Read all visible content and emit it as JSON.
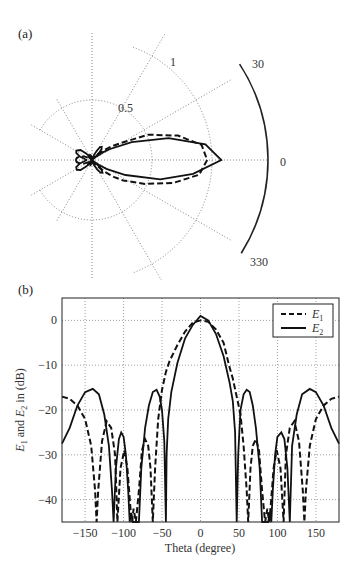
{
  "chart_data": [
    {
      "panel": "(a)",
      "type": "polar-line",
      "r_ticks": [
        "0.5",
        "1"
      ],
      "angle_labels": [
        "30",
        "0",
        "330"
      ],
      "series": [
        {
          "name": "E1",
          "style": "dashed",
          "main_lobe_peak": 1.0,
          "half_width_deg": 45
        },
        {
          "name": "E2",
          "style": "solid",
          "main_lobe_peak": 1.1,
          "half_width_deg": 45
        }
      ],
      "polar_scale": {
        "r_max_px": 120,
        "outer_arc_px": 176
      }
    },
    {
      "panel": "(b)",
      "type": "line",
      "xlabel": "Theta (degree)",
      "ylabel": "E1 and E2 in (dB)",
      "xlim": [
        -180,
        180
      ],
      "ylim": [
        -45,
        5
      ],
      "xticks": [
        -150,
        -100,
        -50,
        0,
        50,
        100,
        150
      ],
      "yticks": [
        0,
        -10,
        -20,
        -30,
        -40
      ],
      "grid": true,
      "legend": {
        "position": "upper right",
        "entries": [
          "E1",
          "E2"
        ]
      },
      "series": [
        {
          "name": "E1",
          "style": "dashed",
          "points": [
            [
              -180,
              -17
            ],
            [
              -170,
              -17.5
            ],
            [
              -160,
              -19
            ],
            [
              -150,
              -22
            ],
            [
              -142,
              -28
            ],
            [
              -137,
              -38
            ],
            [
              -135,
              -45
            ],
            [
              -133,
              -38
            ],
            [
              -128,
              -27
            ],
            [
              -122,
              -22.5
            ],
            [
              -116,
              -24
            ],
            [
              -111,
              -30
            ],
            [
              -108,
              -45
            ],
            [
              -104,
              -33
            ],
            [
              -99,
              -29
            ],
            [
              -95,
              -33
            ],
            [
              -91,
              -42
            ],
            [
              -89,
              -45
            ],
            [
              -87,
              -42
            ],
            [
              -84,
              -45
            ],
            [
              -80,
              -38
            ],
            [
              -76,
              -29
            ],
            [
              -72,
              -26.5
            ],
            [
              -68,
              -28
            ],
            [
              -65,
              -33
            ],
            [
              -62,
              -45
            ],
            [
              -59,
              -33
            ],
            [
              -55,
              -22
            ],
            [
              -50,
              -15.5
            ],
            [
              -45,
              -11.5
            ],
            [
              -40,
              -9
            ],
            [
              -30,
              -5.5
            ],
            [
              -20,
              -2.5
            ],
            [
              -10,
              -0.5
            ],
            [
              0,
              0
            ],
            [
              10,
              -0.3
            ],
            [
              20,
              -2
            ],
            [
              30,
              -5
            ],
            [
              37,
              -10
            ],
            [
              42,
              -13
            ],
            [
              47,
              -17
            ],
            [
              52,
              -21
            ],
            [
              56,
              -28
            ],
            [
              60,
              -38
            ],
            [
              62,
              -45
            ],
            [
              65,
              -33
            ],
            [
              68,
              -28
            ],
            [
              72,
              -26.5
            ],
            [
              76,
              -29
            ],
            [
              80,
              -38
            ],
            [
              84,
              -45
            ],
            [
              87,
              -42
            ],
            [
              89,
              -45
            ],
            [
              91,
              -42
            ],
            [
              95,
              -33
            ],
            [
              99,
              -29
            ],
            [
              104,
              -33
            ],
            [
              108,
              -45
            ],
            [
              111,
              -30
            ],
            [
              116,
              -24
            ],
            [
              122,
              -22.5
            ],
            [
              128,
              -27
            ],
            [
              133,
              -38
            ],
            [
              135,
              -45
            ],
            [
              137,
              -38
            ],
            [
              142,
              -28
            ],
            [
              150,
              -22
            ],
            [
              160,
              -19
            ],
            [
              170,
              -17.5
            ],
            [
              180,
              -17
            ]
          ]
        },
        {
          "name": "E2",
          "style": "solid",
          "points": [
            [
              -180,
              -27.5
            ],
            [
              -170,
              -24
            ],
            [
              -160,
              -19
            ],
            [
              -150,
              -16
            ],
            [
              -140,
              -15.3
            ],
            [
              -132,
              -16.5
            ],
            [
              -125,
              -21
            ],
            [
              -119,
              -28
            ],
            [
              -115,
              -38
            ],
            [
              -113,
              -45
            ],
            [
              -110,
              -33
            ],
            [
              -106,
              -26.5
            ],
            [
              -103,
              -25
            ],
            [
              -100,
              -26
            ],
            [
              -97,
              -30
            ],
            [
              -94,
              -38
            ],
            [
              -92,
              -45
            ],
            [
              -90,
              -43
            ],
            [
              -88,
              -45
            ],
            [
              -80,
              -45
            ],
            [
              -77,
              -33
            ],
            [
              -72,
              -24
            ],
            [
              -67,
              -19
            ],
            [
              -62,
              -16
            ],
            [
              -57,
              -15.5
            ],
            [
              -53,
              -17
            ],
            [
              -50,
              -20
            ],
            [
              -47,
              -27
            ],
            [
              -45,
              -45
            ],
            [
              -44,
              -30
            ],
            [
              -42,
              -22
            ],
            [
              -38,
              -16
            ],
            [
              -30,
              -9.5
            ],
            [
              -20,
              -4
            ],
            [
              -10,
              -1
            ],
            [
              0,
              1
            ],
            [
              10,
              0
            ],
            [
              20,
              -3
            ],
            [
              30,
              -8
            ],
            [
              38,
              -14
            ],
            [
              42,
              -18
            ],
            [
              45,
              -25
            ],
            [
              47,
              -45
            ],
            [
              49,
              -30
            ],
            [
              52,
              -20
            ],
            [
              56,
              -16.5
            ],
            [
              60,
              -15.5
            ],
            [
              64,
              -16
            ],
            [
              68,
              -19
            ],
            [
              72,
              -24
            ],
            [
              77,
              -33
            ],
            [
              80,
              -45
            ],
            [
              88,
              -45
            ],
            [
              90,
              -43
            ],
            [
              92,
              -45
            ],
            [
              94,
              -38
            ],
            [
              97,
              -30
            ],
            [
              100,
              -26
            ],
            [
              105,
              -25
            ],
            [
              109,
              -26.5
            ],
            [
              113,
              -33
            ],
            [
              116,
              -45
            ],
            [
              119,
              -28
            ],
            [
              125,
              -21
            ],
            [
              132,
              -16.5
            ],
            [
              142,
              -15.3
            ],
            [
              150,
              -16
            ],
            [
              160,
              -19
            ],
            [
              170,
              -24
            ],
            [
              180,
              -27.5
            ]
          ]
        }
      ]
    }
  ],
  "labels": {
    "panel_a": "(a)",
    "panel_b": "(b)",
    "r_tick_half": "0.5",
    "r_tick_one": "1",
    "angle_30": "30",
    "angle_0": "0",
    "angle_330": "330",
    "xlabel": "Theta (degree)",
    "ylabel_prefix": "E",
    "legend_e1": "E",
    "legend_e1_sub": "1",
    "legend_e2": "E",
    "legend_e2_sub": "2",
    "xticks": [
      "−150",
      "−100",
      "−50",
      "0",
      "50",
      "100",
      "150"
    ],
    "yticks": [
      "0",
      "−10",
      "−20",
      "−30",
      "−40"
    ]
  }
}
